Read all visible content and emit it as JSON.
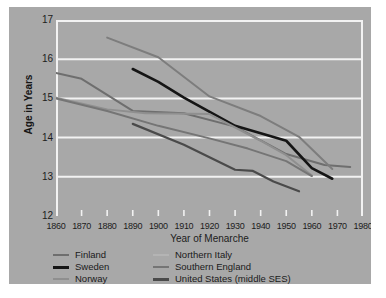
{
  "chart_data": {
    "type": "line",
    "title": "",
    "xlabel": "Year of Menarche",
    "ylabel": "Age in Years",
    "xlim": [
      1860,
      1980
    ],
    "ylim": [
      12,
      17
    ],
    "xticks": [
      1860,
      1870,
      1880,
      1890,
      1900,
      1910,
      1920,
      1930,
      1940,
      1950,
      1960,
      1970,
      1980
    ],
    "yticks": [
      12,
      13,
      14,
      15,
      16,
      17
    ],
    "grid": "horizontal",
    "grid_color": "#f2f2f2",
    "background_color": "#a8a8a8",
    "legend_position": "below",
    "series": [
      {
        "name": "Finland",
        "color": "#6e6e6e",
        "width": 2.0,
        "x": [
          1860,
          1870,
          1890,
          1910,
          1930,
          1950,
          1965,
          1975
        ],
        "y": [
          15.65,
          15.5,
          14.68,
          14.62,
          14.28,
          13.58,
          13.3,
          13.25
        ]
      },
      {
        "name": "Sweden",
        "color": "#151515",
        "width": 2.6,
        "x": [
          1890,
          1900,
          1910,
          1930,
          1950,
          1960,
          1968
        ],
        "y": [
          15.75,
          15.42,
          15.02,
          14.3,
          13.92,
          13.22,
          12.95
        ]
      },
      {
        "name": "Norway",
        "color": "#8f8f8f",
        "width": 2.0,
        "x": [
          1860,
          1880,
          1895,
          1920,
          1940,
          1950,
          1960
        ],
        "y": [
          15.02,
          14.72,
          14.62,
          14.6,
          13.92,
          13.55,
          13.03
        ]
      },
      {
        "name": "Northern Italy",
        "color": "#7d7d7d",
        "width": 2.0,
        "x": [
          1880,
          1900,
          1920,
          1940,
          1955,
          1968
        ],
        "y": [
          16.55,
          16.05,
          15.05,
          14.55,
          14.02,
          13.2
        ]
      },
      {
        "name": "Southern England",
        "color": "#757575",
        "width": 2.0,
        "x": [
          1860,
          1880,
          1900,
          1920,
          1935,
          1950,
          1960
        ],
        "y": [
          15.0,
          14.68,
          14.3,
          13.98,
          13.72,
          13.4,
          13.02
        ]
      },
      {
        "name": "United States (middle SES)",
        "color": "#4a4a4a",
        "width": 2.2,
        "x": [
          1890,
          1910,
          1930,
          1937,
          1945,
          1955
        ],
        "y": [
          14.35,
          13.82,
          13.18,
          13.15,
          12.88,
          12.63
        ]
      }
    ]
  },
  "axes": {
    "y_tick_labels": [
      "17",
      "16",
      "15",
      "14",
      "13",
      "12"
    ],
    "x_tick_labels": [
      "1860",
      "1870",
      "1880",
      "1890",
      "1900",
      "1910",
      "1920",
      "1930",
      "1940",
      "1950",
      "1960",
      "1970",
      "1980"
    ],
    "y_axis_title": "Age in Years",
    "x_axis_title": "Year of Menarche"
  },
  "legend": {
    "left_column": [
      {
        "label": "Finland",
        "color": "#6e6e6e",
        "thickness": "2px"
      },
      {
        "label": "Sweden",
        "color": "#151515",
        "thickness": "3px"
      },
      {
        "label": "Norway",
        "color": "#8f8f8f",
        "thickness": "2px"
      }
    ],
    "right_column": [
      {
        "label": "Northern Italy",
        "color": "#b4b4b4",
        "thickness": "2px"
      },
      {
        "label": "Southern England",
        "color": "#757575",
        "thickness": "2px"
      },
      {
        "label": "United States (middle SES)",
        "color": "#4a4a4a",
        "thickness": "3px"
      }
    ]
  }
}
